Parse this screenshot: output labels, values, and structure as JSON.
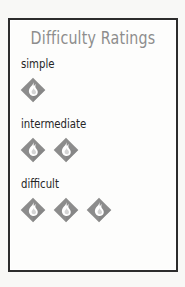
{
  "card": {
    "title": "Difficulty Ratings",
    "title_color": "#8d8d8d",
    "label_color": "#262626",
    "border_color": "#2c2c2c",
    "background_color": "#fdfdfc",
    "page_background_color": "#f8f8f6"
  },
  "icon": {
    "name": "flame-diamond-icon",
    "diamond_color": "#8c8c8c",
    "diamond_shade_color": "#7b7b7b",
    "flame_color": "#ffffff",
    "flame_outline_color": "#6f6f6f"
  },
  "ratings": [
    {
      "label": "simple",
      "icon_count": 1
    },
    {
      "label": "intermediate",
      "icon_count": 2
    },
    {
      "label": "difficult",
      "icon_count": 3
    }
  ]
}
